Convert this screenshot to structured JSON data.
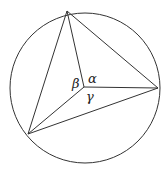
{
  "diagram": {
    "circle": {
      "cx": 85,
      "cy": 88,
      "r": 75
    },
    "center_point": {
      "x": 84,
      "y": 87
    },
    "vertices": [
      {
        "name": "top",
        "x": 67,
        "y": 11
      },
      {
        "name": "right",
        "x": 158,
        "y": 88
      },
      {
        "name": "lower-left",
        "x": 28,
        "y": 134
      }
    ],
    "angle_labels": {
      "alpha": "α",
      "beta": "β",
      "gamma": "γ"
    },
    "stroke_color": "#333333"
  }
}
